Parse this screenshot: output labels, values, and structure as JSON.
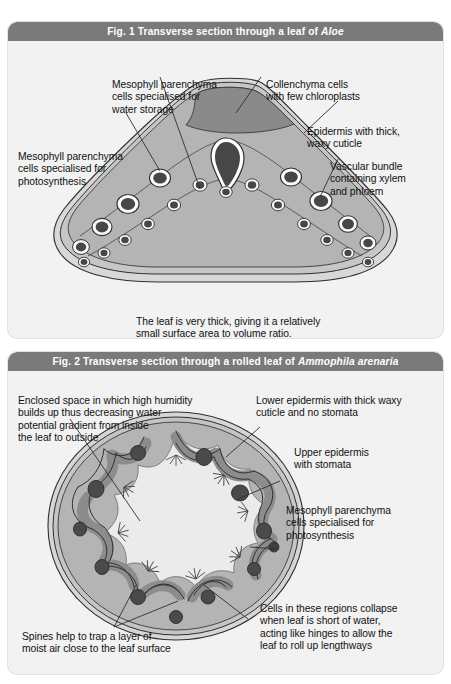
{
  "figure1": {
    "header": {
      "prefix": "Fig. 1  Transverse section through a leaf of ",
      "species": "Aloe"
    },
    "labels": [
      {
        "id": "mesophyll-water-storage",
        "text": "Mesophyll parenchyma\ncells specialised for\nwater storage"
      },
      {
        "id": "collenchyma",
        "text": "Collenchyma cells\nwith few chloroplasts"
      },
      {
        "id": "epidermis-cuticle",
        "text": "Epidermis with thick,\nwaxy cuticle"
      },
      {
        "id": "vascular-bundle",
        "text": "Vascular bundle\ncontaining xylem\nand phloem"
      },
      {
        "id": "mesophyll-photosynthesis",
        "text": "Mesophyll parenchyma\ncells specialised for\nphotosynthesis"
      },
      {
        "id": "leaf-thickness-note",
        "text": "The leaf is very thick, giving it a relatively\nsmall surface area to volume ratio."
      }
    ],
    "colors": {
      "header_bar": "#7a7a7a",
      "panel_background": "#f2f2f2",
      "leaf_fill": "#b4b4b4",
      "leaf_outline": "#3a3a3a",
      "collenchyma_fill": "#8a8a8a",
      "bundle_fill": "#4a4a4a",
      "bundle_ring": "#efefef"
    }
  },
  "figure2": {
    "header": {
      "prefix": "Fig. 2  Transverse section through a rolled leaf of ",
      "species": "Ammophila arenaria"
    },
    "labels": [
      {
        "id": "enclosed-space",
        "text": "Enclosed space in which high humidity\nbuilds up thus decreasing water\npotential gradient from inside\nthe leaf to outside"
      },
      {
        "id": "lower-epidermis",
        "text": "Lower epidermis with thick waxy\ncuticle and no stomata"
      },
      {
        "id": "upper-epidermis",
        "text": "Upper epidermis\nwith stomata"
      },
      {
        "id": "mesophyll-photosynthesis",
        "text": "Mesophyll parenchyma\ncells specialised for\nphotosynthesis"
      },
      {
        "id": "hinge-cells",
        "text": "Cells in these regions collapse\nwhen leaf is short of water,\nacting like hinges to allow the\nleaf to roll up lengthways"
      },
      {
        "id": "spines",
        "text": "Spines help to trap a layer of\nmoist air close to the leaf surface"
      }
    ],
    "colors": {
      "header_bar": "#7a7a7a",
      "panel_background": "#f2f2f2",
      "leaf_fill": "#b4b4b4",
      "leaf_outline": "#3a3a3a",
      "epidermis_band": "#9a9a9a",
      "air_space": "#ebebeb",
      "bundle_fill": "#4a4a4a"
    }
  }
}
